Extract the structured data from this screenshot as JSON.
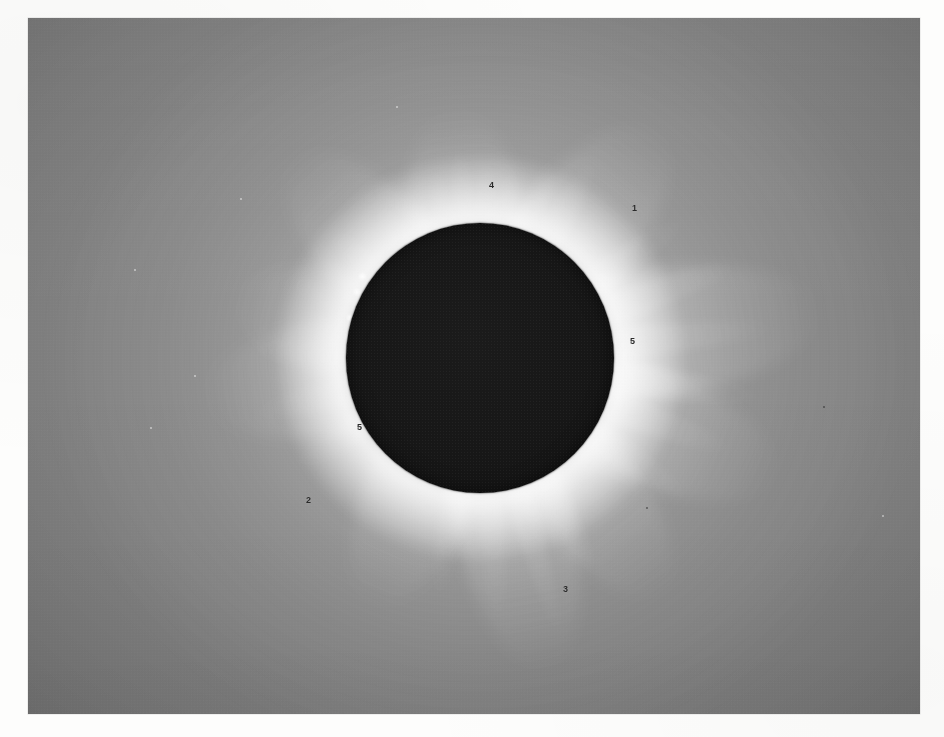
{
  "document": {
    "type": "photographic-print",
    "subject": "Total solar eclipse — solar corona with occulting lunar disk",
    "sheet_background": "#fdfdfc"
  },
  "print": {
    "frame": {
      "x": 28,
      "y": 18,
      "width": 892,
      "height": 696
    },
    "sky_color": "#7e7e7e",
    "sky_highlight": "#8d8d8d",
    "corona_highlight_color": "#f2f2f2",
    "disk_color": "#151515"
  },
  "lunar_disk": {
    "center_x": 480,
    "center_y": 358,
    "radius_x": 134,
    "radius_y": 135
  },
  "annotations": [
    {
      "label": "1",
      "x": 632,
      "y": 204,
      "feature": "north-east-streamer"
    },
    {
      "label": "2",
      "x": 306,
      "y": 496,
      "feature": "south-west-streamer"
    },
    {
      "label": "3",
      "x": 563,
      "y": 585,
      "feature": "south-polar-streamer"
    },
    {
      "label": "4",
      "x": 489,
      "y": 181,
      "feature": "north-polar-rays"
    },
    {
      "label": "5",
      "x": 630,
      "y": 337,
      "feature": "east-equatorial-streamer"
    },
    {
      "label": "5",
      "x": 357,
      "y": 423,
      "feature": "west-equatorial-streamer"
    }
  ],
  "streamers": [
    {
      "name": "north-polar-fan",
      "angle": -96,
      "length": 250,
      "thickness": 120,
      "opacity": 0.92
    },
    {
      "name": "north-west-streamer",
      "angle": -133,
      "length": 275,
      "thickness": 112,
      "opacity": 0.88
    },
    {
      "name": "north-east-streamer",
      "angle": -52,
      "length": 290,
      "thickness": 120,
      "opacity": 0.95
    },
    {
      "name": "east-equatorial",
      "angle": -8,
      "length": 345,
      "thickness": 128,
      "opacity": 1.0
    },
    {
      "name": "east-lower",
      "angle": 22,
      "length": 320,
      "thickness": 120,
      "opacity": 0.95
    },
    {
      "name": "south-east-streamer",
      "angle": 52,
      "length": 300,
      "thickness": 112,
      "opacity": 0.9
    },
    {
      "name": "south-polar-streamer",
      "angle": 78,
      "length": 320,
      "thickness": 120,
      "opacity": 0.92
    },
    {
      "name": "south-west-streamer",
      "angle": 114,
      "length": 270,
      "thickness": 112,
      "opacity": 0.84
    },
    {
      "name": "west-equatorial",
      "angle": 172,
      "length": 280,
      "thickness": 118,
      "opacity": 0.82
    },
    {
      "name": "west-upper",
      "angle": -166,
      "length": 255,
      "thickness": 108,
      "opacity": 0.78
    }
  ],
  "rays": [
    {
      "name": "ray-n-1",
      "angle": -112,
      "length": 180,
      "thickness": 26,
      "opacity": 0.72
    },
    {
      "name": "ray-n-2",
      "angle": -104,
      "length": 200,
      "thickness": 22,
      "opacity": 0.74
    },
    {
      "name": "ray-n-3",
      "angle": -96,
      "length": 215,
      "thickness": 22,
      "opacity": 0.78
    },
    {
      "name": "ray-n-4",
      "angle": -88,
      "length": 205,
      "thickness": 22,
      "opacity": 0.76
    },
    {
      "name": "ray-n-5",
      "angle": -80,
      "length": 195,
      "thickness": 24,
      "opacity": 0.72
    },
    {
      "name": "ray-n-6",
      "angle": -70,
      "length": 215,
      "thickness": 26,
      "opacity": 0.74
    },
    {
      "name": "ray-n-7",
      "angle": -60,
      "length": 230,
      "thickness": 28,
      "opacity": 0.76
    },
    {
      "name": "ray-n-8",
      "angle": -124,
      "length": 185,
      "thickness": 26,
      "opacity": 0.66
    },
    {
      "name": "ray-n-9",
      "angle": -140,
      "length": 200,
      "thickness": 28,
      "opacity": 0.68
    },
    {
      "name": "ray-e-1",
      "angle": -34,
      "length": 250,
      "thickness": 30,
      "opacity": 0.72
    },
    {
      "name": "ray-e-2",
      "angle": -20,
      "length": 275,
      "thickness": 30,
      "opacity": 0.76
    },
    {
      "name": "ray-e-3",
      "angle": -6,
      "length": 295,
      "thickness": 30,
      "opacity": 0.8
    },
    {
      "name": "ray-e-4",
      "angle": 8,
      "length": 285,
      "thickness": 30,
      "opacity": 0.78
    },
    {
      "name": "ray-e-5",
      "angle": 20,
      "length": 270,
      "thickness": 30,
      "opacity": 0.76
    },
    {
      "name": "ray-e-6",
      "angle": 34,
      "length": 255,
      "thickness": 30,
      "opacity": 0.72
    },
    {
      "name": "ray-s-1",
      "angle": 62,
      "length": 250,
      "thickness": 26,
      "opacity": 0.68
    },
    {
      "name": "ray-s-2",
      "angle": 74,
      "length": 290,
      "thickness": 24,
      "opacity": 0.72
    },
    {
      "name": "ray-s-3",
      "angle": 86,
      "length": 265,
      "thickness": 24,
      "opacity": 0.66
    },
    {
      "name": "ray-s-4",
      "angle": 100,
      "length": 245,
      "thickness": 26,
      "opacity": 0.62
    },
    {
      "name": "ray-w-1",
      "angle": 150,
      "length": 215,
      "thickness": 28,
      "opacity": 0.58
    },
    {
      "name": "ray-w-2",
      "angle": 166,
      "length": 235,
      "thickness": 28,
      "opacity": 0.6
    },
    {
      "name": "ray-w-3",
      "angle": -178,
      "length": 230,
      "thickness": 28,
      "opacity": 0.58
    },
    {
      "name": "ray-w-4",
      "angle": -158,
      "length": 205,
      "thickness": 26,
      "opacity": 0.56
    }
  ],
  "prominences": [
    {
      "name": "prominence-nw-1",
      "x": 362,
      "y": 276,
      "size": 9
    },
    {
      "name": "prominence-nw-2",
      "x": 357,
      "y": 292,
      "size": 8
    },
    {
      "name": "prominence-w-1",
      "x": 350,
      "y": 318,
      "size": 8
    },
    {
      "name": "prominence-w-2",
      "x": 348,
      "y": 336,
      "size": 7
    },
    {
      "name": "prominence-e-1",
      "x": 612,
      "y": 343,
      "size": 10
    },
    {
      "name": "prominence-s-1",
      "x": 470,
      "y": 491,
      "size": 7
    }
  ],
  "dust_specks": [
    {
      "x": 106,
      "y": 251,
      "size": 2,
      "tone": "light"
    },
    {
      "x": 212,
      "y": 180,
      "size": 2,
      "tone": "light"
    },
    {
      "x": 166,
      "y": 357,
      "size": 2,
      "tone": "light"
    },
    {
      "x": 122,
      "y": 409,
      "size": 2,
      "tone": "light"
    },
    {
      "x": 368,
      "y": 88,
      "size": 2,
      "tone": "light"
    },
    {
      "x": 795,
      "y": 388,
      "size": 2,
      "tone": "dark"
    },
    {
      "x": 618,
      "y": 489,
      "size": 2,
      "tone": "dark"
    },
    {
      "x": 854,
      "y": 497,
      "size": 2,
      "tone": "light"
    }
  ]
}
